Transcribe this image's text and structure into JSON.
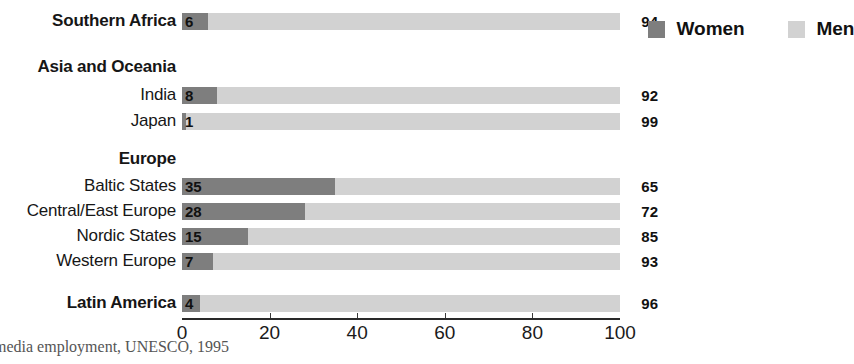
{
  "chart_data": {
    "type": "bar",
    "orientation": "horizontal",
    "stacked": true,
    "stacked_total": 100,
    "title": "",
    "subtitle": "",
    "xlabel": "",
    "ylabel": "",
    "xlim": [
      0,
      100
    ],
    "xticks": [
      0,
      20,
      40,
      60,
      80,
      100
    ],
    "xtick_labels": [
      "0",
      "20",
      "40",
      "60",
      "80",
      "100"
    ],
    "grid": false,
    "legend_position": "top-right",
    "legend": [
      {
        "name": "Women",
        "color": "#7e7e7e"
      },
      {
        "name": "Men",
        "color": "#d2d2d2"
      }
    ],
    "series": [
      {
        "name": "Women",
        "color": "#7e7e7e",
        "values": [
          6,
          null,
          8,
          1,
          null,
          35,
          28,
          15,
          7,
          4
        ]
      },
      {
        "name": "Men",
        "color": "#d2d2d2",
        "values": [
          94,
          null,
          92,
          99,
          null,
          65,
          72,
          85,
          93,
          96
        ]
      }
    ],
    "categories": [
      "Southern Africa",
      "Asia and Oceania",
      "India",
      "Japan",
      "Europe",
      "Baltic States",
      "Central/East Europe",
      "Nordic States",
      "Western Europe",
      "Latin America"
    ],
    "rows": [
      {
        "label": "Southern Africa",
        "kind": "group",
        "has_bar": true,
        "women": 6,
        "men": 94
      },
      {
        "label": "Asia and Oceania",
        "kind": "group",
        "has_bar": false,
        "women": null,
        "men": null
      },
      {
        "label": "India",
        "kind": "sub",
        "has_bar": true,
        "women": 8,
        "men": 92
      },
      {
        "label": "Japan",
        "kind": "sub",
        "has_bar": true,
        "women": 1,
        "men": 99
      },
      {
        "label": "Europe",
        "kind": "group",
        "has_bar": false,
        "women": null,
        "men": null
      },
      {
        "label": "Baltic States",
        "kind": "sub",
        "has_bar": true,
        "women": 35,
        "men": 65
      },
      {
        "label": "Central/East Europe",
        "kind": "sub",
        "has_bar": true,
        "women": 28,
        "men": 72
      },
      {
        "label": "Nordic States",
        "kind": "sub",
        "has_bar": true,
        "women": 15,
        "men": 85
      },
      {
        "label": "Western Europe",
        "kind": "sub",
        "has_bar": true,
        "women": 7,
        "men": 93
      },
      {
        "label": "Latin America",
        "kind": "group",
        "has_bar": true,
        "women": 4,
        "men": 96
      }
    ]
  },
  "rows": [
    {
      "label": "Southern Africa",
      "women_label": "6",
      "men_label": "94"
    },
    {
      "label": "Asia and Oceania",
      "women_label": "",
      "men_label": ""
    },
    {
      "label": "India",
      "women_label": "8",
      "men_label": "92"
    },
    {
      "label": "Japan",
      "women_label": "1",
      "men_label": "99"
    },
    {
      "label": "Europe",
      "women_label": "",
      "men_label": ""
    },
    {
      "label": "Baltic States",
      "women_label": "35",
      "men_label": "65"
    },
    {
      "label": "Central/East Europe",
      "women_label": "28",
      "men_label": "72"
    },
    {
      "label": "Nordic States",
      "women_label": "15",
      "men_label": "85"
    },
    {
      "label": "Western Europe",
      "women_label": "7",
      "men_label": "93"
    },
    {
      "label": "Latin America",
      "women_label": "4",
      "men_label": "96"
    }
  ],
  "axis": {
    "tick_labels": [
      "0",
      "20",
      "40",
      "60",
      "80",
      "100"
    ]
  },
  "legend": {
    "women_label": "Women",
    "men_label": "Men"
  },
  "caption": {
    "text": "media employment, UNESCO, 1995"
  },
  "colors": {
    "women": "#7e7e7e",
    "men": "#d2d2d2",
    "axis": "#2a2a2a",
    "text": "#161616",
    "caption": "#555555"
  }
}
